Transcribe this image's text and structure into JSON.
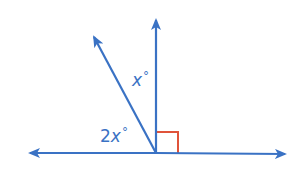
{
  "diagram": {
    "type": "angle-diagram",
    "colors": {
      "lines": "#3a72c4",
      "right_angle_marker": "#e0533a",
      "background": "#ffffff"
    },
    "labels": {
      "upper_angle": {
        "coef": "",
        "var": "x",
        "deg": "°"
      },
      "lower_angle": {
        "coef": "2",
        "var": "x",
        "deg": "°"
      }
    },
    "elements": {
      "horizontal_line": "line with arrows both ends",
      "vertical_ray": "ray perpendicular to line",
      "slanted_ray": "ray between vertical and left",
      "right_angle_marker": "90° marker between vertical ray and right side"
    }
  }
}
